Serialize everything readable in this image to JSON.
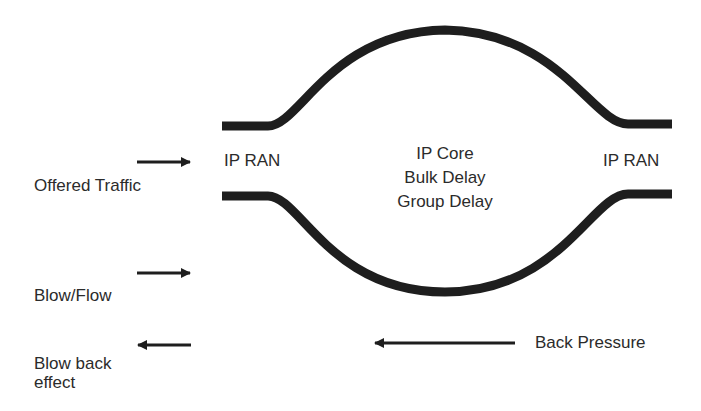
{
  "diagram": {
    "labels": {
      "ip_ran_left": "IP RAN",
      "ip_ran_right": "IP RAN",
      "core_lines": [
        "IP Core",
        "Bulk Delay",
        "Group Delay"
      ],
      "offered_traffic": "Offered Traffic",
      "blow_flow": "Blow/Flow",
      "blow_back_line1": "Blow back",
      "blow_back_line2": "effect",
      "back_pressure": "Back Pressure"
    },
    "arrows": [
      {
        "name": "offered-traffic-arrow",
        "direction": "right"
      },
      {
        "name": "blow-flow-arrow",
        "direction": "right"
      },
      {
        "name": "blow-back-arrow",
        "direction": "left"
      },
      {
        "name": "back-pressure-arrow",
        "direction": "left"
      }
    ],
    "colors": {
      "pipe": "#1e1e1e",
      "arrow": "#1e1e1e",
      "text": "#2b2b2b",
      "background": "#ffffff"
    }
  }
}
